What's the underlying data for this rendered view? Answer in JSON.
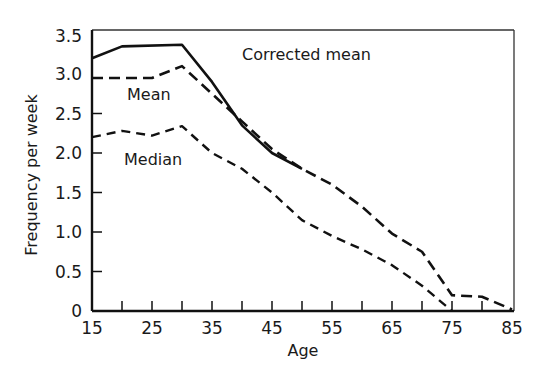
{
  "chart_data": {
    "type": "line",
    "title": "",
    "xlabel": "Age",
    "ylabel": "Frequency per week",
    "xlim": [
      15,
      85
    ],
    "ylim": [
      0,
      3.5
    ],
    "x_ticks": [
      "15",
      "25",
      "35",
      "45",
      "55",
      "65",
      "75",
      "85"
    ],
    "y_ticks": [
      "0",
      "0.5",
      "1.0",
      "1.5",
      "2.0",
      "2.5",
      "3.0",
      "3.5"
    ],
    "grid": false,
    "legend": "inline labels",
    "series": [
      {
        "name": "Corrected mean",
        "style": "solid",
        "x": [
          15,
          20,
          30,
          35,
          40,
          45,
          50
        ],
        "values": [
          3.2,
          3.35,
          3.37,
          2.9,
          2.35,
          2.0,
          1.8
        ]
      },
      {
        "name": "Mean",
        "style": "dashed",
        "x": [
          15,
          25,
          30,
          35,
          40,
          45,
          50,
          55,
          60,
          65,
          70,
          75,
          80,
          85
        ],
        "values": [
          2.95,
          2.95,
          3.1,
          2.75,
          2.4,
          2.05,
          1.8,
          1.6,
          1.32,
          0.98,
          0.75,
          0.2,
          0.18,
          0.02
        ]
      },
      {
        "name": "Median",
        "style": "dash-dot",
        "x": [
          15,
          20,
          25,
          30,
          35,
          40,
          45,
          50,
          55,
          60,
          65,
          70,
          75
        ],
        "values": [
          2.2,
          2.28,
          2.22,
          2.34,
          2.0,
          1.8,
          1.5,
          1.15,
          0.95,
          0.78,
          0.58,
          0.32,
          0.0
        ]
      }
    ]
  },
  "labels": {
    "corrected_mean": "Corrected mean",
    "mean": "Mean",
    "median": "Median",
    "xlabel": "Age",
    "ylabel": "Frequency per week"
  }
}
